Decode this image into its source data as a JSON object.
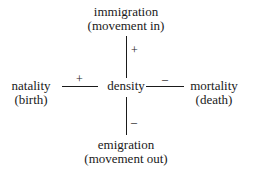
{
  "diagram": {
    "center": {
      "label": "density"
    },
    "nodes": {
      "top": {
        "line1": "immigration",
        "line2": "(movement in)",
        "sign": "+"
      },
      "left": {
        "line1": "natality",
        "line2": "(birth)",
        "sign": "+"
      },
      "right": {
        "line1": "mortality",
        "line2": "(death)",
        "sign": "–"
      },
      "bottom": {
        "line1": "emigration",
        "line2": "(movement out)",
        "sign": "–"
      }
    }
  }
}
